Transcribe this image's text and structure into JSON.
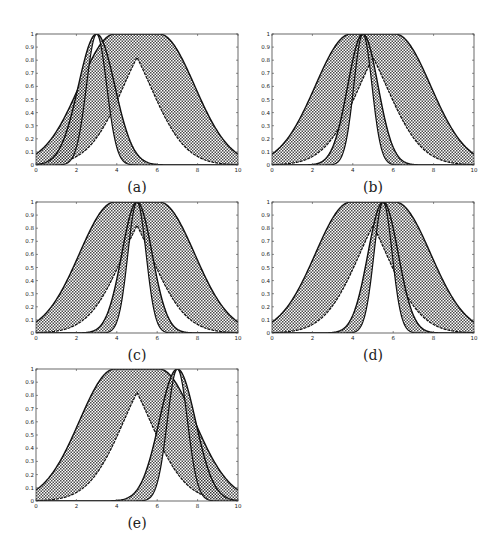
{
  "chart_data": [
    {
      "type": "area",
      "panel_label": "(a)",
      "xlim": [
        0,
        10
      ],
      "ylim": [
        0,
        1
      ],
      "xticks": [
        "0",
        "2",
        "4",
        "6",
        "8",
        "10"
      ],
      "yticks": [
        "0",
        "0.1",
        "0.2",
        "0.3",
        "0.4",
        "0.5",
        "0.6",
        "0.7",
        "0.8",
        "0.9",
        "1"
      ],
      "grid": false,
      "series": [
        {
          "name": "wide FOU",
          "kind": "uncertain-mean gaussian",
          "mean_range": [
            3.9,
            6.1
          ],
          "sigma": 1.75
        },
        {
          "name": "narrow FOU",
          "kind": "uncertain-sigma gaussian",
          "mean": 3.0,
          "sigma_range": [
            0.5,
            0.9
          ]
        }
      ]
    },
    {
      "type": "area",
      "panel_label": "(b)",
      "xlim": [
        0,
        10
      ],
      "ylim": [
        0,
        1
      ],
      "xticks": [
        "0",
        "2",
        "4",
        "6",
        "8",
        "10"
      ],
      "yticks": [
        "0",
        "0.1",
        "0.2",
        "0.3",
        "0.4",
        "0.5",
        "0.6",
        "0.7",
        "0.8",
        "0.9",
        "1"
      ],
      "grid": false,
      "series": [
        {
          "name": "wide FOU",
          "kind": "uncertain-mean gaussian",
          "mean_range": [
            3.9,
            6.1
          ],
          "sigma": 1.75
        },
        {
          "name": "narrow FOU",
          "kind": "uncertain-sigma gaussian",
          "mean": 4.5,
          "sigma_range": [
            0.45,
            0.75
          ]
        }
      ]
    },
    {
      "type": "area",
      "panel_label": "(c)",
      "xlim": [
        0,
        10
      ],
      "ylim": [
        0,
        1
      ],
      "xticks": [
        "0",
        "2",
        "4",
        "6",
        "8",
        "10"
      ],
      "yticks": [
        "0",
        "0.1",
        "0.2",
        "0.3",
        "0.4",
        "0.5",
        "0.6",
        "0.7",
        "0.8",
        "0.9",
        "1"
      ],
      "grid": false,
      "series": [
        {
          "name": "wide FOU",
          "kind": "uncertain-mean gaussian",
          "mean_range": [
            3.9,
            6.1
          ],
          "sigma": 1.75
        },
        {
          "name": "narrow FOU",
          "kind": "uncertain-sigma gaussian",
          "mean": 5.0,
          "sigma_range": [
            0.45,
            0.75
          ]
        }
      ]
    },
    {
      "type": "area",
      "panel_label": "(d)",
      "xlim": [
        0,
        10
      ],
      "ylim": [
        0,
        1
      ],
      "xticks": [
        "0",
        "2",
        "4",
        "6",
        "8",
        "10"
      ],
      "yticks": [
        "0",
        "0.1",
        "0.2",
        "0.3",
        "0.4",
        "0.5",
        "0.6",
        "0.7",
        "0.8",
        "0.9",
        "1"
      ],
      "grid": false,
      "series": [
        {
          "name": "wide FOU",
          "kind": "uncertain-mean gaussian",
          "mean_range": [
            3.9,
            6.1
          ],
          "sigma": 1.75
        },
        {
          "name": "narrow FOU",
          "kind": "uncertain-sigma gaussian",
          "mean": 5.5,
          "sigma_range": [
            0.45,
            0.75
          ]
        }
      ]
    },
    {
      "type": "area",
      "panel_label": "(e)",
      "xlim": [
        0,
        10
      ],
      "ylim": [
        0,
        1
      ],
      "xticks": [
        "0",
        "2",
        "4",
        "6",
        "8",
        "10"
      ],
      "yticks": [
        "0",
        "0.1",
        "0.2",
        "0.3",
        "0.4",
        "0.5",
        "0.6",
        "0.7",
        "0.8",
        "0.9",
        "1"
      ],
      "grid": false,
      "series": [
        {
          "name": "wide FOU",
          "kind": "uncertain-mean gaussian",
          "mean_range": [
            3.9,
            6.1
          ],
          "sigma": 1.75
        },
        {
          "name": "narrow FOU",
          "kind": "uncertain-sigma gaussian",
          "mean": 7.0,
          "sigma_range": [
            0.5,
            0.9
          ]
        }
      ]
    }
  ]
}
